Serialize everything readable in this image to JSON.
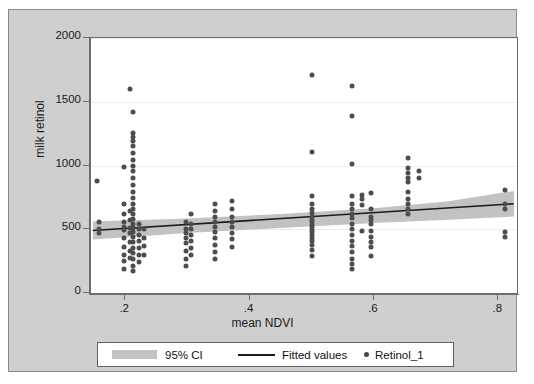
{
  "chart_data": {
    "type": "scatter",
    "title": "",
    "xlabel": "mean NDVI",
    "ylabel": "milk retinol",
    "xlim": [
      0.145,
      0.83
    ],
    "ylim": [
      0,
      2000
    ],
    "xticks": [
      0.2,
      0.4,
      0.6,
      0.8
    ],
    "xticklabels": [
      ".2",
      ".4",
      ".6",
      ".8"
    ],
    "yticks": [
      0,
      500,
      1000,
      1500,
      2000
    ],
    "yticklabels": [
      "0",
      "500",
      "1000",
      "1500",
      "2000"
    ],
    "grid": "horizontal",
    "legend_position": "below-axis",
    "legend": [
      {
        "label": "95% CI",
        "marker": "band",
        "color": "#c2c2c2"
      },
      {
        "label": "Fitted values",
        "marker": "line",
        "color": "#1a1a1a"
      },
      {
        "label": "Retinol_1",
        "marker": "dot",
        "color": "#4a4a4a"
      }
    ],
    "series": [
      {
        "name": "Retinol_1",
        "marker": "dot",
        "color": "#4d4d4d",
        "points": [
          [
            0.155,
            880
          ],
          [
            0.158,
            560
          ],
          [
            0.158,
            505
          ],
          [
            0.158,
            470
          ],
          [
            0.198,
            990
          ],
          [
            0.198,
            700
          ],
          [
            0.198,
            620
          ],
          [
            0.198,
            560
          ],
          [
            0.198,
            520
          ],
          [
            0.198,
            495
          ],
          [
            0.198,
            430
          ],
          [
            0.198,
            360
          ],
          [
            0.198,
            300
          ],
          [
            0.198,
            250
          ],
          [
            0.198,
            185
          ],
          [
            0.207,
            1600
          ],
          [
            0.207,
            640
          ],
          [
            0.207,
            575
          ],
          [
            0.207,
            510
          ],
          [
            0.207,
            470
          ],
          [
            0.207,
            400
          ],
          [
            0.207,
            330
          ],
          [
            0.207,
            275
          ],
          [
            0.212,
            1420
          ],
          [
            0.212,
            1255
          ],
          [
            0.212,
            1225
          ],
          [
            0.212,
            1190
          ],
          [
            0.212,
            1155
          ],
          [
            0.212,
            1095
          ],
          [
            0.212,
            1040
          ],
          [
            0.212,
            1000
          ],
          [
            0.212,
            960
          ],
          [
            0.212,
            900
          ],
          [
            0.212,
            845
          ],
          [
            0.212,
            790
          ],
          [
            0.212,
            745
          ],
          [
            0.212,
            700
          ],
          [
            0.212,
            660
          ],
          [
            0.212,
            620
          ],
          [
            0.212,
            580
          ],
          [
            0.212,
            545
          ],
          [
            0.212,
            510
          ],
          [
            0.212,
            480
          ],
          [
            0.212,
            440
          ],
          [
            0.212,
            400
          ],
          [
            0.212,
            355
          ],
          [
            0.212,
            310
          ],
          [
            0.212,
            265
          ],
          [
            0.212,
            215
          ],
          [
            0.212,
            170
          ],
          [
            0.222,
            545
          ],
          [
            0.222,
            500
          ],
          [
            0.222,
            455
          ],
          [
            0.222,
            410
          ],
          [
            0.222,
            350
          ],
          [
            0.222,
            300
          ],
          [
            0.222,
            245
          ],
          [
            0.231,
            505
          ],
          [
            0.231,
            430
          ],
          [
            0.231,
            365
          ],
          [
            0.231,
            300
          ],
          [
            0.298,
            560
          ],
          [
            0.298,
            505
          ],
          [
            0.298,
            470
          ],
          [
            0.298,
            430
          ],
          [
            0.298,
            390
          ],
          [
            0.298,
            330
          ],
          [
            0.298,
            270
          ],
          [
            0.298,
            210
          ],
          [
            0.305,
            620
          ],
          [
            0.305,
            545
          ],
          [
            0.305,
            500
          ],
          [
            0.305,
            455
          ],
          [
            0.305,
            405
          ],
          [
            0.305,
            350
          ],
          [
            0.305,
            295
          ],
          [
            0.345,
            700
          ],
          [
            0.345,
            640
          ],
          [
            0.345,
            600
          ],
          [
            0.345,
            555
          ],
          [
            0.345,
            520
          ],
          [
            0.345,
            480
          ],
          [
            0.345,
            430
          ],
          [
            0.345,
            380
          ],
          [
            0.345,
            325
          ],
          [
            0.345,
            270
          ],
          [
            0.372,
            720
          ],
          [
            0.372,
            660
          ],
          [
            0.372,
            600
          ],
          [
            0.372,
            560
          ],
          [
            0.372,
            515
          ],
          [
            0.372,
            470
          ],
          [
            0.372,
            420
          ],
          [
            0.372,
            360
          ],
          [
            0.5,
            1710
          ],
          [
            0.5,
            1105
          ],
          [
            0.5,
            760
          ],
          [
            0.5,
            700
          ],
          [
            0.5,
            660
          ],
          [
            0.5,
            625
          ],
          [
            0.5,
            600
          ],
          [
            0.5,
            575
          ],
          [
            0.5,
            555
          ],
          [
            0.5,
            535
          ],
          [
            0.5,
            515
          ],
          [
            0.5,
            495
          ],
          [
            0.5,
            475
          ],
          [
            0.5,
            455
          ],
          [
            0.5,
            430
          ],
          [
            0.5,
            405
          ],
          [
            0.5,
            380
          ],
          [
            0.5,
            340
          ],
          [
            0.5,
            290
          ],
          [
            0.565,
            1620
          ],
          [
            0.565,
            1390
          ],
          [
            0.565,
            1010
          ],
          [
            0.565,
            760
          ],
          [
            0.565,
            700
          ],
          [
            0.565,
            660
          ],
          [
            0.565,
            620
          ],
          [
            0.565,
            585
          ],
          [
            0.565,
            545
          ],
          [
            0.565,
            500
          ],
          [
            0.565,
            455
          ],
          [
            0.565,
            410
          ],
          [
            0.565,
            365
          ],
          [
            0.565,
            320
          ],
          [
            0.565,
            270
          ],
          [
            0.565,
            230
          ],
          [
            0.565,
            190
          ],
          [
            0.58,
            770
          ],
          [
            0.58,
            735
          ],
          [
            0.58,
            690
          ],
          [
            0.58,
            490
          ],
          [
            0.595,
            785
          ],
          [
            0.595,
            655
          ],
          [
            0.595,
            600
          ],
          [
            0.595,
            570
          ],
          [
            0.595,
            540
          ],
          [
            0.595,
            490
          ],
          [
            0.595,
            440
          ],
          [
            0.595,
            400
          ],
          [
            0.595,
            360
          ],
          [
            0.595,
            290
          ],
          [
            0.655,
            1055
          ],
          [
            0.655,
            980
          ],
          [
            0.655,
            940
          ],
          [
            0.655,
            905
          ],
          [
            0.655,
            870
          ],
          [
            0.655,
            790
          ],
          [
            0.655,
            740
          ],
          [
            0.655,
            700
          ],
          [
            0.655,
            660
          ],
          [
            0.655,
            620
          ],
          [
            0.672,
            960
          ],
          [
            0.672,
            905
          ],
          [
            0.81,
            810
          ],
          [
            0.81,
            700
          ],
          [
            0.81,
            660
          ],
          [
            0.81,
            480
          ],
          [
            0.81,
            440
          ]
        ]
      }
    ],
    "fit": {
      "name": "Fitted values",
      "color": "#1a1a1a",
      "x": [
        0.148,
        0.825
      ],
      "y": [
        490,
        700
      ]
    },
    "ci": {
      "name": "95% CI",
      "color": "#c2c2c2",
      "level": 95,
      "x": [
        0.148,
        0.3,
        0.45,
        0.6,
        0.72,
        0.825
      ],
      "lower": [
        420,
        470,
        510,
        550,
        575,
        600
      ],
      "upper": [
        560,
        585,
        620,
        665,
        720,
        800
      ]
    }
  }
}
